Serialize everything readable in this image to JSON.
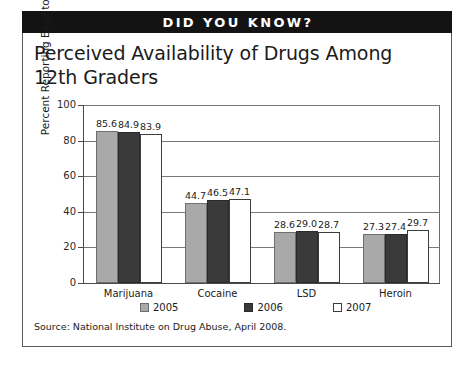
{
  "banner": {
    "text": "DID YOU KNOW?"
  },
  "headline": "Perceived Availability of Drugs Among 12th Graders",
  "source": "Source: National Institute on Drug Abuse, April 2008.",
  "colors": {
    "banner_background": "#131313",
    "banner_text": "#ffffff",
    "series_2005": "#a9a9a9",
    "series_2006": "#3a3a3a",
    "series_2007": "#ffffff",
    "axis": "#4a4a4a",
    "gridline": "#7a7a7a",
    "frame": "#5a5a5a",
    "text": "#1b1b1b"
  },
  "legend": {
    "position": "bottom",
    "items": [
      {
        "label": "2005",
        "swatch": "series_2005"
      },
      {
        "label": "2006",
        "swatch": "series_2006"
      },
      {
        "label": "2007",
        "swatch": "series_2007"
      }
    ]
  },
  "chart_data": {
    "type": "bar",
    "title": "Perceived Availability of Drugs Among 12th Graders",
    "subtitle": "",
    "xlabel": "",
    "ylabel": "Percent Reporting Easy to Obtain",
    "ylim": [
      0,
      100
    ],
    "yticks": [
      0,
      20,
      40,
      60,
      80,
      100
    ],
    "ytick_labels": [
      "0",
      "20",
      "40",
      "60",
      "80",
      "100"
    ],
    "grid": true,
    "grid_axis": "y",
    "legend_position": "bottom",
    "categories": [
      "Marijuana",
      "Cocaine",
      "LSD",
      "Heroin"
    ],
    "series": [
      {
        "name": "2005",
        "values": [
          85.6,
          44.7,
          28.6,
          27.3
        ],
        "labels": [
          "85.6",
          "44.7",
          "28.6",
          "27.3"
        ],
        "color": "#a9a9a9"
      },
      {
        "name": "2006",
        "values": [
          84.9,
          46.5,
          29.0,
          27.4
        ],
        "labels": [
          "84.9",
          "46.5",
          "29.0",
          "27.4"
        ],
        "color": "#3a3a3a"
      },
      {
        "name": "2007",
        "values": [
          83.9,
          47.1,
          28.7,
          29.7
        ],
        "labels": [
          "83.9",
          "47.1",
          "28.7",
          "29.7"
        ],
        "color": "#ffffff"
      }
    ],
    "source": "Source: National Institute on Drug Abuse, April 2008."
  }
}
